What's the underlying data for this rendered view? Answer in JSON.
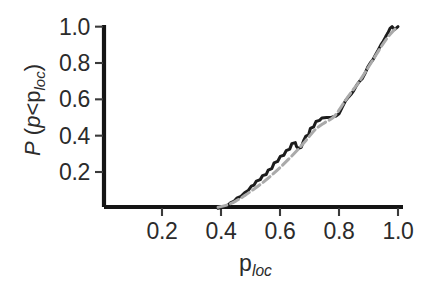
{
  "chart_data": {
    "type": "line",
    "title": "",
    "xlabel": "p_loc",
    "ylabel": "P (p<p_loc)",
    "xlabel_parts": {
      "base": "p",
      "sub": "loc"
    },
    "ylabel_parts": {
      "prefix": "P",
      "open": " (",
      "inner_p": "p",
      "lt": "<",
      "base": "p",
      "sub": "loc",
      "close": ")"
    },
    "xlim": [
      0.0,
      1.02
    ],
    "ylim": [
      0.0,
      1.04
    ],
    "xticks": [
      0.2,
      0.4,
      0.6,
      0.8,
      1.0
    ],
    "xticklabels": [
      "0.2",
      "0.4",
      "0.6",
      "0.8",
      "1.0"
    ],
    "yticks": [
      0.2,
      0.4,
      0.6,
      0.8,
      1.0
    ],
    "yticklabels": [
      "0.2",
      "0.4",
      "0.6",
      "0.8",
      "1.0"
    ],
    "grid": false,
    "legend": "none",
    "tick_direction": "out",
    "spines": [
      "left",
      "bottom"
    ],
    "series": [
      {
        "name": "empirical-cdf",
        "style": "solid",
        "color": "#1c1c1c",
        "width": 3.0,
        "points": [
          [
            0.39,
            0.0
          ],
          [
            0.405,
            0.006
          ],
          [
            0.42,
            0.012
          ],
          [
            0.432,
            0.03
          ],
          [
            0.445,
            0.04
          ],
          [
            0.455,
            0.058
          ],
          [
            0.468,
            0.066
          ],
          [
            0.48,
            0.086
          ],
          [
            0.492,
            0.098
          ],
          [
            0.503,
            0.122
          ],
          [
            0.512,
            0.128
          ],
          [
            0.52,
            0.15
          ],
          [
            0.533,
            0.158
          ],
          [
            0.541,
            0.18
          ],
          [
            0.553,
            0.186
          ],
          [
            0.56,
            0.21
          ],
          [
            0.572,
            0.218
          ],
          [
            0.58,
            0.25
          ],
          [
            0.592,
            0.258
          ],
          [
            0.601,
            0.286
          ],
          [
            0.613,
            0.292
          ],
          [
            0.621,
            0.318
          ],
          [
            0.633,
            0.326
          ],
          [
            0.64,
            0.356
          ],
          [
            0.652,
            0.362
          ],
          [
            0.656,
            0.34
          ],
          [
            0.662,
            0.33
          ],
          [
            0.672,
            0.336
          ],
          [
            0.68,
            0.372
          ],
          [
            0.688,
            0.398
          ],
          [
            0.697,
            0.404
          ],
          [
            0.703,
            0.44
          ],
          [
            0.714,
            0.448
          ],
          [
            0.722,
            0.478
          ],
          [
            0.734,
            0.484
          ],
          [
            0.742,
            0.497
          ],
          [
            0.758,
            0.5
          ],
          [
            0.775,
            0.502
          ],
          [
            0.79,
            0.508
          ],
          [
            0.8,
            0.52
          ],
          [
            0.812,
            0.56
          ],
          [
            0.822,
            0.592
          ],
          [
            0.832,
            0.612
          ],
          [
            0.841,
            0.628
          ],
          [
            0.85,
            0.648
          ],
          [
            0.86,
            0.678
          ],
          [
            0.87,
            0.7
          ],
          [
            0.878,
            0.712
          ],
          [
            0.888,
            0.742
          ],
          [
            0.897,
            0.776
          ],
          [
            0.906,
            0.8
          ],
          [
            0.915,
            0.818
          ],
          [
            0.924,
            0.846
          ],
          [
            0.933,
            0.872
          ],
          [
            0.942,
            0.9
          ],
          [
            0.95,
            0.92
          ],
          [
            0.958,
            0.944
          ],
          [
            0.966,
            0.966
          ],
          [
            0.973,
            0.99
          ],
          [
            0.98,
            1.0
          ],
          [
            0.988,
            0.984
          ],
          [
            0.994,
            0.992
          ],
          [
            1.0,
            1.0
          ]
        ]
      },
      {
        "name": "reference-curve",
        "style": "dashed",
        "color": "#aaaaaa",
        "width": 3.0,
        "points": [
          [
            0.39,
            0.006
          ],
          [
            0.42,
            0.018
          ],
          [
            0.45,
            0.04
          ],
          [
            0.48,
            0.07
          ],
          [
            0.51,
            0.104
          ],
          [
            0.54,
            0.14
          ],
          [
            0.57,
            0.18
          ],
          [
            0.6,
            0.224
          ],
          [
            0.63,
            0.272
          ],
          [
            0.66,
            0.322
          ],
          [
            0.69,
            0.378
          ],
          [
            0.72,
            0.434
          ],
          [
            0.75,
            0.47
          ],
          [
            0.78,
            0.5
          ],
          [
            0.8,
            0.54
          ],
          [
            0.82,
            0.59
          ],
          [
            0.84,
            0.636
          ],
          [
            0.86,
            0.678
          ],
          [
            0.88,
            0.726
          ],
          [
            0.9,
            0.778
          ],
          [
            0.92,
            0.83
          ],
          [
            0.94,
            0.882
          ],
          [
            0.96,
            0.93
          ],
          [
            0.98,
            0.97
          ],
          [
            1.0,
            1.0
          ]
        ]
      }
    ]
  }
}
